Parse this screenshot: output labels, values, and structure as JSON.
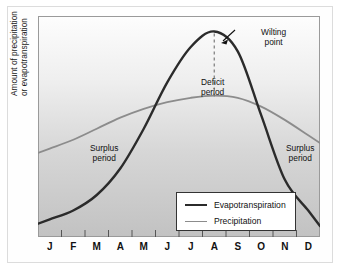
{
  "chart_data": {
    "type": "line",
    "title": "",
    "xlabel": "",
    "ylabel": "Amount of precipitation or evapotranspiration",
    "ylabel_lines": [
      "Amount of precipitation",
      "or evapotranspiration"
    ],
    "categories": [
      "J",
      "F",
      "M",
      "A",
      "M",
      "J",
      "J",
      "A",
      "S",
      "O",
      "N",
      "D"
    ],
    "xlim": [
      0,
      12
    ],
    "ylim": [
      0,
      100
    ],
    "grid": false,
    "legend_position": "lower-center",
    "series": [
      {
        "name": "Evapotranspiration",
        "color": "#2b2b2b",
        "values": [
          8,
          12,
          19,
          31,
          49,
          70,
          86,
          93,
          84,
          55,
          26,
          12
        ]
      },
      {
        "name": "Precipitation",
        "color": "#8c8c8c",
        "values": [
          40,
          44,
          49,
          54,
          58,
          61,
          63,
          64,
          63,
          59,
          53,
          46
        ]
      }
    ],
    "annotations": [
      {
        "id": "surplus-left",
        "lines": [
          "Surplus",
          "period"
        ]
      },
      {
        "id": "surplus-right",
        "lines": [
          "Surplus",
          "period"
        ]
      },
      {
        "id": "deficit",
        "lines": [
          "Deficit",
          "period"
        ]
      },
      {
        "id": "wilting",
        "lines": [
          "Wilting",
          "point"
        ]
      }
    ]
  },
  "legend": {
    "items": [
      {
        "label": "Evapotranspiration",
        "color": "#2b2b2b",
        "width": "2.2px"
      },
      {
        "label": "Precipitation",
        "color": "#8c8c8c",
        "width": "1.6px"
      }
    ]
  },
  "colors": {
    "evapotranspiration": "#2b2b2b",
    "precipitation": "#8c8c8c",
    "plot_bg_top": "#fdfdfd",
    "plot_bg_bottom": "#c4c4c4",
    "frame": "#9a9a9a",
    "wilting_dash": "#7a7a7a"
  }
}
